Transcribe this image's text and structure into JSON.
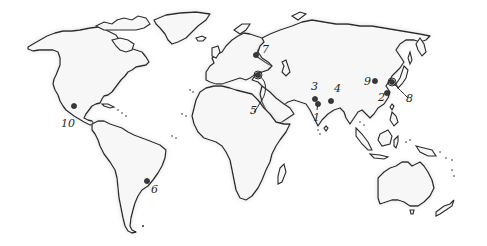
{
  "map": {
    "type": "world-outline",
    "background": "#ffffff",
    "land_fill": "#f7f7f7",
    "outline_color": "#2a2a2a",
    "marker_color": "#3a3a3a"
  },
  "markers": [
    {
      "id": "1",
      "label": "1",
      "region": "western India",
      "dot": [
        318,
        103
      ],
      "label_pos": [
        313,
        121
      ]
    },
    {
      "id": "2",
      "label": "2",
      "region": "eastern China",
      "dot": [
        387,
        93
      ],
      "label_pos": [
        378,
        101
      ]
    },
    {
      "id": "3",
      "label": "3",
      "region": "Pakistan / Indus",
      "dot": [
        315,
        99
      ],
      "label_pos": [
        311,
        89
      ]
    },
    {
      "id": "4",
      "label": "4",
      "region": "northern India",
      "dot": [
        331,
        101
      ],
      "label_pos": [
        334,
        91
      ]
    },
    {
      "id": "5",
      "label": "5",
      "region": "Anatolia / Levant",
      "dot": [
        258,
        76
      ],
      "label_pos": [
        250,
        113
      ]
    },
    {
      "id": "6",
      "label": "6",
      "region": "southeastern Brazil",
      "dot": [
        147,
        181
      ],
      "label_pos": [
        151,
        192
      ]
    },
    {
      "id": "7",
      "label": "7",
      "region": "western Russia",
      "dot": [
        256,
        54
      ],
      "label_pos": [
        263,
        52
      ]
    },
    {
      "id": "8",
      "label": "8",
      "region": "Korea",
      "dot": [
        392,
        82
      ],
      "label_pos": [
        407,
        101
      ]
    },
    {
      "id": "9",
      "label": "9",
      "region": "northern China",
      "dot": [
        375,
        81
      ],
      "label_pos": [
        365,
        83
      ]
    },
    {
      "id": "10",
      "label": "10",
      "region": "central Mexico",
      "dot": [
        74,
        106
      ],
      "label_pos": [
        63,
        127
      ]
    }
  ]
}
